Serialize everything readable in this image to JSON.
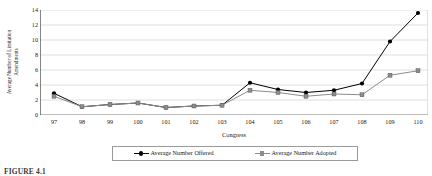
{
  "chart_data": {
    "type": "line",
    "title": "",
    "xlabel": "Congress",
    "ylabel_lines": [
      "Average Number of Limitation",
      "Amendments"
    ],
    "ylabel": "Average Number of Limitation Amendments",
    "categories": [
      "97",
      "98",
      "99",
      "100",
      "101",
      "102",
      "103",
      "104",
      "105",
      "106",
      "107",
      "108",
      "109",
      "110"
    ],
    "ylim": [
      0,
      14
    ],
    "yticks": [
      0,
      2,
      4,
      6,
      8,
      10,
      12,
      14
    ],
    "grid": true,
    "grid_axis": "y",
    "legend_position": "bottom",
    "series": [
      {
        "name": "Average Number Offered",
        "marker": "circle",
        "color": "#000000",
        "values": [
          2.9,
          1.1,
          1.4,
          1.6,
          1.0,
          1.2,
          1.3,
          4.3,
          3.4,
          3.0,
          3.3,
          4.2,
          9.8,
          13.6
        ]
      },
      {
        "name": "Average Number Adopted",
        "marker": "square",
        "color": "#8c8c8c",
        "values": [
          2.5,
          1.1,
          1.4,
          1.6,
          1.0,
          1.2,
          1.3,
          3.3,
          3.0,
          2.5,
          2.8,
          2.7,
          5.3,
          5.9
        ]
      }
    ]
  },
  "legend": {
    "items": [
      {
        "label": "Average Number Offered"
      },
      {
        "label": "Average Number Adopted"
      }
    ]
  },
  "caption": "FIGURE 4.1",
  "colors": {
    "offered": "#000000",
    "adopted": "#8c8c8c",
    "grid": "#c9c9c9",
    "axis": "#555555",
    "text": "#1a1a1a"
  }
}
